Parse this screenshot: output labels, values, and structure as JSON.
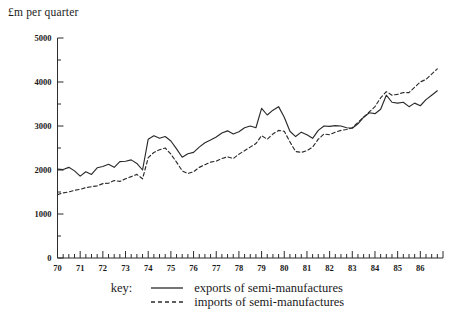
{
  "chart_data": {
    "type": "line",
    "title": "",
    "ylabel": "£m per quarter",
    "xlabel": "",
    "ylim": [
      0,
      5000
    ],
    "xlim": [
      1970.0,
      1987.0
    ],
    "grid": false,
    "legend_position": "bottom-center",
    "y_ticks": [
      0,
      1000,
      2000,
      3000,
      4000,
      5000
    ],
    "y_tick_labels": [
      "0",
      "1000",
      "2000",
      "3000",
      "4000",
      "5000"
    ],
    "y_minor_tick_interval": 500,
    "x_ticks": [
      1970,
      1971,
      1972,
      1973,
      1974,
      1975,
      1976,
      1977,
      1978,
      1979,
      1980,
      1981,
      1982,
      1983,
      1984,
      1985,
      1986
    ],
    "x_tick_labels": [
      "70",
      "71",
      "72",
      "73",
      "74",
      "75",
      "76",
      "77",
      "78",
      "79",
      "80",
      "81",
      "82",
      "83",
      "84",
      "85",
      "86"
    ],
    "x_minor_tick_interval": 0.25,
    "x": [
      1970.0,
      1970.25,
      1970.5,
      1970.75,
      1971.0,
      1971.25,
      1971.5,
      1971.75,
      1972.0,
      1972.25,
      1972.5,
      1972.75,
      1973.0,
      1973.25,
      1973.5,
      1973.75,
      1974.0,
      1974.25,
      1974.5,
      1974.75,
      1975.0,
      1975.25,
      1975.5,
      1975.75,
      1976.0,
      1976.25,
      1976.5,
      1976.75,
      1977.0,
      1977.25,
      1977.5,
      1977.75,
      1978.0,
      1978.25,
      1978.5,
      1978.75,
      1979.0,
      1979.25,
      1979.5,
      1979.75,
      1980.0,
      1980.25,
      1980.5,
      1980.75,
      1981.0,
      1981.25,
      1981.5,
      1981.75,
      1982.0,
      1982.25,
      1982.5,
      1982.75,
      1983.0,
      1983.25,
      1983.5,
      1983.75,
      1984.0,
      1984.25,
      1984.5,
      1984.75,
      1985.0,
      1985.25,
      1985.5,
      1985.75,
      1986.0,
      1986.25,
      1986.5,
      1986.75
    ],
    "series": [
      {
        "name": "exports of semi-manufactures",
        "style": "solid",
        "color": "#2b2b2b",
        "values": [
          2020,
          2010,
          2060,
          1980,
          1860,
          1960,
          1900,
          2050,
          2080,
          2130,
          2060,
          2190,
          2200,
          2230,
          2150,
          2000,
          2700,
          2780,
          2720,
          2760,
          2660,
          2480,
          2290,
          2370,
          2400,
          2520,
          2620,
          2680,
          2750,
          2840,
          2890,
          2820,
          2870,
          2960,
          3000,
          2960,
          3400,
          3250,
          3360,
          3440,
          3200,
          2880,
          2760,
          2860,
          2800,
          2720,
          2900,
          3000,
          2990,
          3010,
          3000,
          2960,
          2950,
          3050,
          3200,
          3300,
          3280,
          3380,
          3700,
          3540,
          3520,
          3540,
          3440,
          3520,
          3460,
          3600,
          3700,
          3800
        ]
      },
      {
        "name": "imports of semi-manufactures",
        "style": "dashed",
        "color": "#2b2b2b",
        "values": [
          1440,
          1480,
          1500,
          1540,
          1560,
          1600,
          1620,
          1640,
          1690,
          1700,
          1760,
          1740,
          1800,
          1850,
          1900,
          1800,
          2280,
          2400,
          2460,
          2500,
          2360,
          2180,
          1980,
          1920,
          1960,
          2060,
          2120,
          2180,
          2200,
          2260,
          2300,
          2260,
          2360,
          2440,
          2520,
          2600,
          2780,
          2700,
          2820,
          2900,
          2880,
          2640,
          2420,
          2400,
          2440,
          2520,
          2700,
          2820,
          2800,
          2860,
          2900,
          2920,
          2960,
          3080,
          3200,
          3320,
          3440,
          3640,
          3780,
          3700,
          3720,
          3760,
          3760,
          3880,
          4000,
          4060,
          4180,
          4300
        ]
      }
    ]
  },
  "legend": {
    "key_label": "key:",
    "entries": [
      {
        "label": "exports of semi-manufactures",
        "style": "solid"
      },
      {
        "label": "imports of semi-manufactures",
        "style": "dashed"
      }
    ]
  }
}
